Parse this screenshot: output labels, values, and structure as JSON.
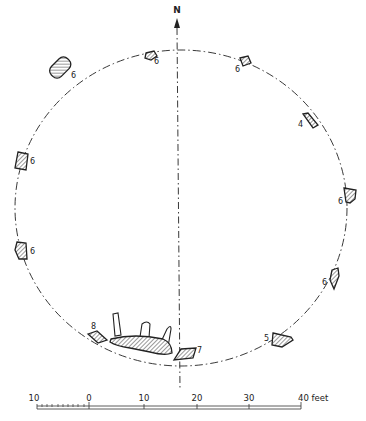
{
  "figure": {
    "type": "stone-circle-plan",
    "north_label": "N",
    "circle": {
      "style": "dash-dot",
      "color": "#222222"
    },
    "stones": [
      {
        "id": "stone-top-left",
        "label": "6"
      },
      {
        "id": "stone-upper-left",
        "label": "6"
      },
      {
        "id": "stone-left-upper",
        "label": "6"
      },
      {
        "id": "stone-left-lower",
        "label": "6"
      },
      {
        "id": "stone-top-right",
        "label": "6"
      },
      {
        "id": "stone-right-upper",
        "label": "4"
      },
      {
        "id": "stone-right-mid",
        "label": "6"
      },
      {
        "id": "stone-right-lower",
        "label": "6"
      },
      {
        "id": "stone-bottom-right",
        "label": "5"
      },
      {
        "id": "stone-bottom-center",
        "label": "7"
      },
      {
        "id": "stone-bottom-left",
        "label": "8"
      }
    ],
    "recumbent": {
      "description": "recumbent stone with flankers"
    }
  },
  "scale_bar": {
    "ticks": [
      "10",
      "0",
      "10",
      "20",
      "30",
      "40"
    ],
    "unit": "feet",
    "end_label": "40 feet"
  }
}
